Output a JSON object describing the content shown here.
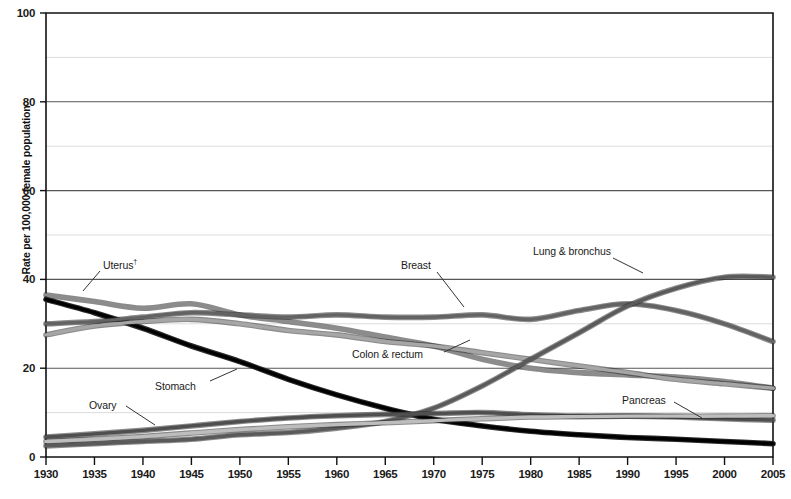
{
  "chart_data": {
    "type": "line",
    "title": "",
    "subtitle": "",
    "xlabel": "",
    "ylabel": "Rate per 100,000 female population",
    "xlim": [
      1930,
      2005
    ],
    "ylim": [
      0,
      100
    ],
    "grid": true,
    "grid_major_step": 20,
    "grid_minor_step": 10,
    "legend_position": "inline-annotations",
    "xticks": [
      1930,
      1935,
      1940,
      1945,
      1950,
      1955,
      1960,
      1965,
      1970,
      1975,
      1980,
      1985,
      1990,
      1995,
      2000,
      2005
    ],
    "yticks": [
      0,
      20,
      40,
      60,
      80,
      100
    ],
    "x": [
      1930,
      1935,
      1940,
      1945,
      1950,
      1955,
      1960,
      1965,
      1970,
      1975,
      1980,
      1985,
      1990,
      1995,
      2000,
      2005
    ],
    "series": [
      {
        "name": "Uterus",
        "label": "Uterus",
        "label_superscript": "†",
        "color": "#8c8c8c",
        "values": [
          36.5,
          35.0,
          33.5,
          34.5,
          32.0,
          30.5,
          29.0,
          27.0,
          25.0,
          22.0,
          20.0,
          19.0,
          18.5,
          18.0,
          17.0,
          15.5
        ]
      },
      {
        "name": "Stomach",
        "label": "Stomach",
        "color": "#000000",
        "values": [
          35.5,
          32.5,
          29.0,
          25.0,
          21.5,
          17.5,
          14.0,
          11.0,
          8.5,
          7.0,
          5.8,
          5.0,
          4.4,
          4.0,
          3.5,
          3.0
        ]
      },
      {
        "name": "Breast",
        "label": "Breast",
        "color": "#636363",
        "values": [
          30.0,
          30.5,
          31.5,
          32.5,
          32.0,
          31.5,
          32.0,
          31.5,
          31.5,
          32.0,
          31.0,
          33.0,
          34.5,
          33.0,
          30.0,
          26.0
        ]
      },
      {
        "name": "Colon & rectum",
        "label": "Colon & rectum",
        "color": "#a6a6a6",
        "values": [
          27.5,
          29.5,
          30.5,
          31.0,
          30.0,
          28.5,
          27.5,
          26.0,
          25.0,
          23.5,
          22.0,
          20.5,
          19.0,
          17.5,
          16.5,
          15.5
        ]
      },
      {
        "name": "Lung & bronchus",
        "label": "Lung & bronchus",
        "color": "#5a5a5a",
        "values": [
          2.5,
          3.0,
          3.5,
          4.0,
          5.0,
          5.5,
          6.5,
          8.0,
          11.0,
          16.0,
          22.0,
          28.0,
          34.0,
          38.0,
          40.5,
          40.5
        ]
      },
      {
        "name": "Ovary",
        "label": "Ovary",
        "color": "#4f4f4f",
        "values": [
          4.5,
          5.2,
          6.0,
          7.0,
          8.0,
          8.8,
          9.3,
          9.6,
          9.8,
          10.0,
          9.5,
          9.2,
          9.2,
          9.0,
          8.6,
          8.3
        ]
      },
      {
        "name": "Pancreas",
        "label": "Pancreas",
        "color": "#bdbdbd",
        "values": [
          3.5,
          4.0,
          4.6,
          5.4,
          6.2,
          6.8,
          7.3,
          7.7,
          8.2,
          8.6,
          9.0,
          9.1,
          9.2,
          9.2,
          9.2,
          9.3
        ]
      }
    ],
    "annotations": [
      {
        "text": "Uterus",
        "superscript": "†",
        "x_px": 103,
        "y_px": 258,
        "leader_x1": 100,
        "leader_y1": 271,
        "leader_x2": 83,
        "leader_y2": 291
      },
      {
        "text": "Breast",
        "x_px": 401,
        "y_px": 259,
        "leader_x1": 437,
        "leader_y1": 272,
        "leader_x2": 464,
        "leader_y2": 307
      },
      {
        "text": "Lung & bronchus",
        "x_px": 533,
        "y_px": 245,
        "leader_x1": 613,
        "leader_y1": 258,
        "leader_x2": 643,
        "leader_y2": 273
      },
      {
        "text": "Colon & rectum",
        "x_px": 352,
        "y_px": 348,
        "leader_x1": 444,
        "leader_y1": 352,
        "leader_x2": 470,
        "leader_y2": 340
      },
      {
        "text": "Stomach",
        "x_px": 155,
        "y_px": 380,
        "leader_x1": 210,
        "leader_y1": 381,
        "leader_x2": 237,
        "leader_y2": 369
      },
      {
        "text": "Ovary",
        "x_px": 89,
        "y_px": 399,
        "leader_x1": 126,
        "leader_y1": 406,
        "leader_x2": 155,
        "leader_y2": 425
      },
      {
        "text": "Pancreas",
        "x_px": 622,
        "y_px": 394,
        "leader_x1": 674,
        "leader_y1": 402,
        "leader_x2": 702,
        "leader_y2": 418
      }
    ]
  },
  "axis": {
    "ylabel": "Rate per 100,000 female population",
    "ytick_labels": [
      "0",
      "20",
      "40",
      "60",
      "80",
      "100"
    ],
    "xtick_labels": [
      "1930",
      "1935",
      "1940",
      "1945",
      "1950",
      "1955",
      "1960",
      "1965",
      "1970",
      "1975",
      "1980",
      "1985",
      "1990",
      "1995",
      "2000",
      "2005"
    ]
  },
  "colors": {
    "axis": "#111111",
    "grid_major": "#555555",
    "grid_minor": "#d8d8d8",
    "background": "#ffffff"
  }
}
